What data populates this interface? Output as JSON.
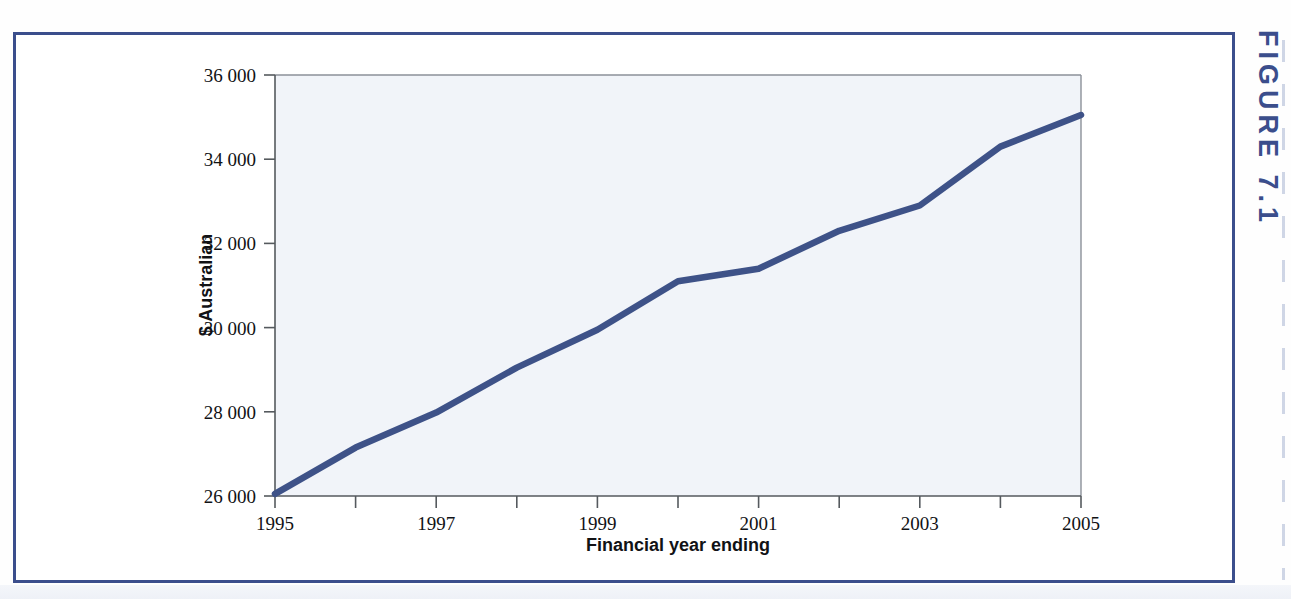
{
  "figure": {
    "caption": "FIGURE 7.1"
  },
  "chart_data": {
    "type": "line",
    "title": "",
    "xlabel": "Financial year ending",
    "ylabel": "$ Australian",
    "x": [
      1995,
      1996,
      1997,
      1998,
      1999,
      2000,
      2001,
      2002,
      2003,
      2004,
      2005
    ],
    "values": [
      26050,
      27150,
      27980,
      29050,
      29950,
      31100,
      31400,
      32300,
      32900,
      34300,
      35050
    ],
    "series": [
      {
        "name": "Average earnings",
        "values": [
          26050,
          27150,
          27980,
          29050,
          29950,
          31100,
          31400,
          32300,
          32900,
          34300,
          35050
        ]
      }
    ],
    "xlim": [
      1995,
      2005
    ],
    "ylim": [
      26000,
      36000
    ],
    "xticks": [
      1995,
      1997,
      1999,
      2001,
      2003,
      2005
    ],
    "xtick_labels": [
      "1995",
      "1997",
      "1999",
      "2001",
      "2003",
      "2005"
    ],
    "xminor_ticks": [
      1996,
      1998,
      2000,
      2002,
      2004
    ],
    "yticks": [
      26000,
      28000,
      30000,
      32000,
      34000,
      36000
    ],
    "ytick_labels": [
      "26 000",
      "28 000",
      "30 000",
      "32 000",
      "34 000",
      "36 000"
    ],
    "grid": false,
    "legend": false,
    "line_color": "#3e5288",
    "plot_background": "#f1f4f9",
    "frame_color": "#3b4e8c"
  }
}
